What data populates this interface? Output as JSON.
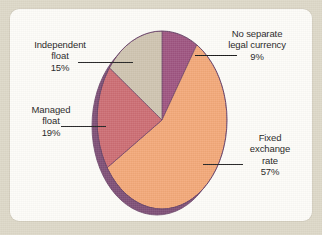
{
  "page": {
    "background_color": "#ddd8c8",
    "card_color": "#fdfcf8"
  },
  "chart_data": {
    "type": "pie",
    "title": "",
    "subtitle": "",
    "xlabel": "",
    "ylabel": "",
    "legend_position": "callout-labels",
    "grid": false,
    "categories": [
      "No separate legal currency",
      "Fixed exchange rate",
      "Managed float",
      "Independent float"
    ],
    "values": [
      9,
      57,
      19,
      15
    ],
    "units": "percent",
    "total": 100,
    "slices": [
      {
        "name": "No separate legal currency",
        "label": "No separate\nlegal currency",
        "value": 9,
        "value_text": "9%",
        "color": "#9e5480",
        "start_angle": 0,
        "end_angle": 32.4
      },
      {
        "name": "Fixed exchange rate",
        "label": "Fixed\nexchange\nrate",
        "value": 57,
        "value_text": "57%",
        "color": "#f3a878",
        "start_angle": 32.4,
        "end_angle": 237.6
      },
      {
        "name": "Managed float",
        "label": "Managed\nfloat",
        "value": 19,
        "value_text": "19%",
        "color": "#cc6d73",
        "start_angle": 237.6,
        "end_angle": 306.0
      },
      {
        "name": "Independent float",
        "label": "Independent\nfloat",
        "value": 15,
        "value_text": "15%",
        "color": "#cfc4b0",
        "start_angle": 306.0,
        "end_angle": 360.0
      }
    ],
    "rim_color": "#7e4f76",
    "outline_color": "#6b4468"
  },
  "labels": {
    "no_separate_legal_currency": {
      "text": "No separate\nlegal currency",
      "percent": "9%"
    },
    "independent_float": {
      "text": "Independent\nfloat",
      "percent": "15%"
    },
    "managed_float": {
      "text": "Managed\nfloat",
      "percent": "19%"
    },
    "fixed_exchange_rate": {
      "text": "Fixed\nexchange\nrate",
      "percent": "57%"
    }
  }
}
